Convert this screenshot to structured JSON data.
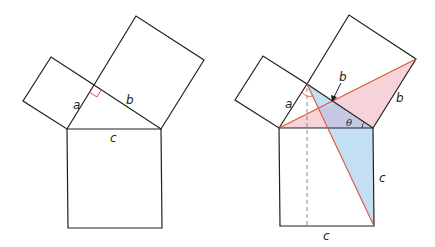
{
  "figure": {
    "left_panel": {
      "description": "Pythagorean theorem: squares on sides a, b, c of a right triangle",
      "labels": {
        "a": "a",
        "b": "b",
        "c": "c"
      },
      "right_angle_marker_color": "#e0533d"
    },
    "right_panel": {
      "description": "Proof construction with shaded triangles and angle theta",
      "labels": {
        "a": "a",
        "b_inner": "b",
        "b_outer": "b",
        "c_side": "c",
        "c_bottom": "c",
        "theta": "θ"
      },
      "colors": {
        "edge": "#231f20",
        "construction_line": "#e0533d",
        "pink_fill": "#f6d3d8",
        "blue_fill": "#bcdcf2",
        "overlap_fill": "#c9c9e2",
        "dashed_line": "#8a8a8a"
      }
    }
  }
}
